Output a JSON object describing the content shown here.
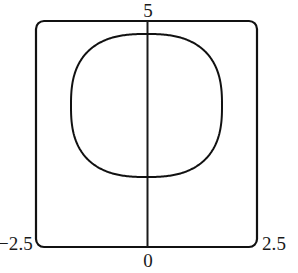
{
  "figure": {
    "title": "",
    "frame_color": "#111111",
    "curve_color": "#111111",
    "axis_color": "#1a1a1a",
    "background": "#ffffff"
  },
  "labels": {
    "top": "5",
    "bottom": "0",
    "left": "−2.5",
    "right": "2.5"
  },
  "chart_data": {
    "type": "line",
    "title": "",
    "xlabel": "",
    "ylabel": "",
    "xlim": [
      -2.5,
      2.5
    ],
    "ylim": [
      0,
      5
    ],
    "xticks": [
      -2.5,
      0,
      2.5
    ],
    "xticklabels": [
      "−2.5",
      "0",
      "2.5"
    ],
    "yticks": [
      5
    ],
    "yticklabels": [
      "5"
    ],
    "grid": false,
    "legend": null,
    "frame": {
      "style": "rounded-box",
      "corner_radius_px": 8,
      "visible": true
    },
    "annotations": [
      {
        "name": "vertical-axis",
        "type": "vline",
        "x": 0,
        "y_from": 0,
        "y_to": 5
      }
    ],
    "series": [
      {
        "name": "closed-superellipse-curve",
        "type": "closed-curve",
        "description": "Closed superellipse (Lamé-type) curve centered near x=0",
        "center": [
          0.0,
          3.15
        ],
        "radius_x": 1.71,
        "radius_y": 1.57,
        "exponent": 2.6,
        "x_extent": [
          -1.71,
          1.71
        ],
        "y_extent": [
          1.58,
          4.72
        ],
        "points_count": 400
      }
    ]
  },
  "geometry": {
    "frame": {
      "x": 36,
      "y": 21,
      "width": 221,
      "height": 226,
      "radius": 8,
      "stroke": 2.2
    },
    "vline": {
      "x": 147.5,
      "y1": 21,
      "y2": 247,
      "stroke": 2.0
    },
    "curve": {
      "cx": 146.5,
      "cy": 105.5,
      "rx": 75.5,
      "ry": 71.5,
      "n": 2.6,
      "stroke": 2.0
    }
  }
}
